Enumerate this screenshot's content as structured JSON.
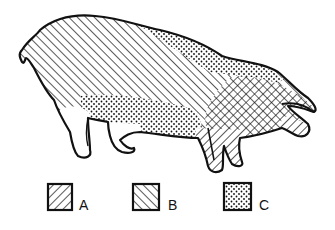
{
  "figure": {
    "colors": {
      "ink": "#111111",
      "background": "#ffffff"
    }
  },
  "legend": [
    {
      "key": "A",
      "label": "A",
      "pattern": "diagonal-forward-hatch"
    },
    {
      "key": "B",
      "label": "B",
      "pattern": "diagonal-back-hatch"
    },
    {
      "key": "C",
      "label": "C",
      "pattern": "stipple-dots"
    }
  ]
}
